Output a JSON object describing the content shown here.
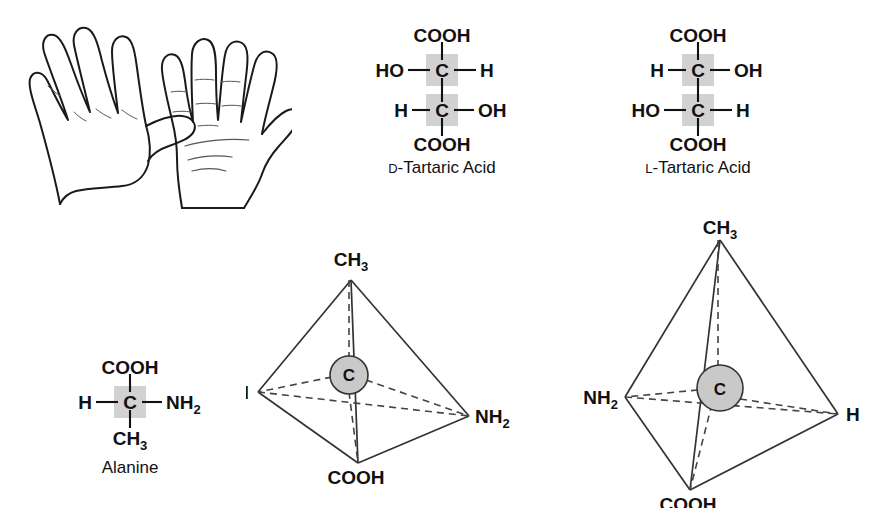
{
  "figure": {
    "name": "chirality-illustration",
    "colors": {
      "ink": "#111111",
      "edge": "#333333",
      "highlight_gray": "#d2d2d2",
      "sphere_gray": "#c9c9c9",
      "background": "#ffffff"
    }
  },
  "hands": {
    "label": "pair-of-hands-line-drawing",
    "left_hand": "left-hand-back-view",
    "right_hand": "right-hand-palm-view"
  },
  "fischer_d_tartaric": {
    "caption_prefix": "D",
    "caption_rest": "-Tartaric Acid",
    "top": "COOH",
    "bottom": "COOH",
    "center_top": "C",
    "center_bottom": "C",
    "top_left": "HO",
    "top_right": "H",
    "bottom_left": "H",
    "bottom_right": "OH"
  },
  "fischer_l_tartaric": {
    "caption_prefix": "L",
    "caption_rest": "-Tartaric Acid",
    "top": "COOH",
    "bottom": "COOH",
    "center_top": "C",
    "center_bottom": "C",
    "top_left": "H",
    "top_right": "OH",
    "bottom_left": "HO",
    "bottom_right": "H"
  },
  "fischer_alanine": {
    "caption": "Alanine",
    "top": "COOH",
    "center": "C",
    "left": "H",
    "right_main": "NH",
    "right_sub": "2",
    "bottom_main": "CH",
    "bottom_sub": "3"
  },
  "tetrahedron_left": {
    "name": "l-alanine-tetrahedral-model",
    "apex_main": "CH",
    "apex_sub": "3",
    "center": "C",
    "front_bottom": "COOH",
    "left_vertex": "H",
    "right_vertex_main": "NH",
    "right_vertex_sub": "2"
  },
  "tetrahedron_right": {
    "name": "d-alanine-tetrahedral-model",
    "apex_main": "CH",
    "apex_sub": "3",
    "center": "C",
    "front_bottom": "COOH",
    "left_vertex_main": "NH",
    "left_vertex_sub": "2",
    "right_vertex": "H"
  }
}
